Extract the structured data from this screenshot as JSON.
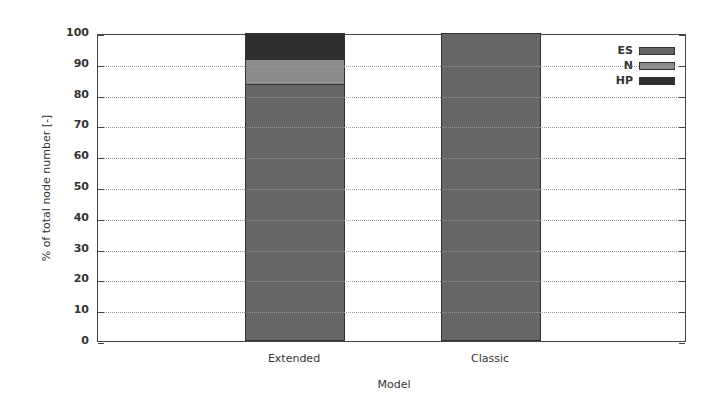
{
  "chart_data": {
    "type": "bar",
    "stacked": true,
    "title": "",
    "xlabel": "Model",
    "ylabel": "% of total node number [-]",
    "ylim": [
      0,
      100
    ],
    "yticks": [
      0,
      10,
      20,
      30,
      40,
      50,
      60,
      70,
      80,
      90,
      100
    ],
    "grid": "horizontal dotted",
    "legend_position": "top-right (inside)",
    "categories": [
      "Extended",
      "Classic"
    ],
    "series": [
      {
        "name": "ES",
        "color": "#666666",
        "values": [
          83.4,
          100
        ]
      },
      {
        "name": "N",
        "color": "#8c8c8c",
        "values": [
          8.2,
          0
        ]
      },
      {
        "name": "HP",
        "color": "#2e2e2e",
        "values": [
          8.4,
          0
        ]
      }
    ]
  }
}
